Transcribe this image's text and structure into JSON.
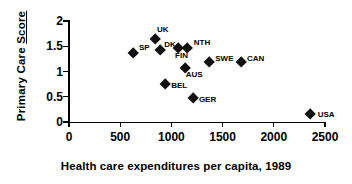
{
  "chart_data": {
    "type": "scatter",
    "title": "",
    "xlabel": "Health care expenditures per capita, 1989",
    "ylabel_parts": {
      "plain": "Primary Care ",
      "underlined": "Score"
    },
    "ylabel": "Primary Care Score",
    "xlim": [
      0,
      2500
    ],
    "ylim": [
      0,
      2
    ],
    "xticks": [
      0,
      500,
      1000,
      1500,
      2000,
      2500
    ],
    "xtick_labels": [
      "0",
      "500",
      "1000",
      "1500",
      "2000",
      "2500"
    ],
    "yticks": [
      0,
      0.5,
      1,
      1.5,
      2
    ],
    "ytick_labels": [
      "0",
      "0.5",
      "1",
      "1.5",
      "2"
    ],
    "grid": false,
    "legend": "none",
    "marker": "diamond",
    "marker_color": "#111111",
    "points": [
      {
        "label": "SP",
        "x": 625,
        "y": 1.37,
        "label_dx": 6,
        "label_dy": -9
      },
      {
        "label": "UK",
        "x": 840,
        "y": 1.63,
        "label_dx": 2,
        "label_dy": -14
      },
      {
        "label": "DK",
        "x": 890,
        "y": 1.43,
        "label_dx": 4,
        "label_dy": -9
      },
      {
        "label": "FIN",
        "x": 1065,
        "y": 1.46,
        "label_dx": -3,
        "label_dy": 4
      },
      {
        "label": "NTH",
        "x": 1150,
        "y": 1.47,
        "label_dx": 7,
        "label_dy": -9
      },
      {
        "label": "AUS",
        "x": 1130,
        "y": 1.07,
        "label_dx": 1,
        "label_dy": 3
      },
      {
        "label": "BEL",
        "x": 940,
        "y": 0.75,
        "label_dx": 6,
        "label_dy": -2
      },
      {
        "label": "GER",
        "x": 1210,
        "y": 0.47,
        "label_dx": 6,
        "label_dy": -2
      },
      {
        "label": "SWE",
        "x": 1370,
        "y": 1.19,
        "label_dx": 6,
        "label_dy": -7
      },
      {
        "label": "CAN",
        "x": 1680,
        "y": 1.19,
        "label_dx": 6,
        "label_dy": -7
      },
      {
        "label": "USA",
        "x": 2360,
        "y": 0.16,
        "label_dx": 7,
        "label_dy": -3
      }
    ]
  }
}
